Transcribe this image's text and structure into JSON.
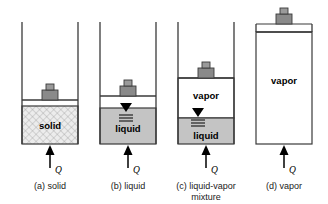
{
  "figure": {
    "colors": {
      "outline": "#3a3a3a",
      "liquid_fill": "#c4c4c4",
      "solid_fill": "#e8e8e8",
      "vapor_fill": "#ffffff",
      "piston_fill": "#7f7f7f",
      "weight_fill": "#8c8c8c",
      "marker": "#000000",
      "text": "#000000"
    },
    "heat_symbol": "Q",
    "icons": {
      "heat_arrow": "up-arrow-icon",
      "liquid_level": "liquid-level-marker-icon",
      "piston": "piston-icon",
      "weight": "weight-icon"
    }
  },
  "panels": [
    {
      "id": "a",
      "caption_lines": [
        "(a) solid"
      ],
      "heat_label": "Q",
      "regions": [
        {
          "name": "solid",
          "label": "solid",
          "fill": "hatched"
        }
      ],
      "has_level_marker": false,
      "piston_height_fraction": 0.45
    },
    {
      "id": "b",
      "caption_lines": [
        "(b) liquid"
      ],
      "heat_label": "Q",
      "regions": [
        {
          "name": "liquid",
          "label": "liquid",
          "fill": "grey"
        }
      ],
      "has_level_marker": true,
      "piston_height_fraction": 0.55
    },
    {
      "id": "c",
      "caption_lines": [
        "(c) liquid-vapor",
        "mixture"
      ],
      "heat_label": "Q",
      "regions": [
        {
          "name": "vapor",
          "label": "vapor",
          "fill": "white"
        },
        {
          "name": "liquid",
          "label": "liquid",
          "fill": "grey"
        }
      ],
      "has_level_marker": true,
      "piston_height_fraction": 0.78
    },
    {
      "id": "d",
      "caption_lines": [
        "(d) vapor"
      ],
      "heat_label": "Q",
      "regions": [
        {
          "name": "vapor",
          "label": "vapor",
          "fill": "white"
        }
      ],
      "has_level_marker": false,
      "piston_height_fraction": 1.0
    }
  ]
}
